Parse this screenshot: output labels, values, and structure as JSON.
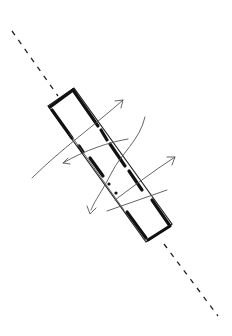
{
  "diagram": {
    "type": "hand-drawn-sketch",
    "colors": {
      "background": "#ffffff",
      "ink": "#111111",
      "light_ink": "#555555"
    },
    "elements": {
      "axis": "dashed diagonal axis line",
      "block": "rectangular block with thick wall strokes",
      "arrows": [
        "flow-arrow-upper-right",
        "flow-arrow-left",
        "flow-arrow-right",
        "flow-arrow-down"
      ],
      "dots": 2
    }
  }
}
